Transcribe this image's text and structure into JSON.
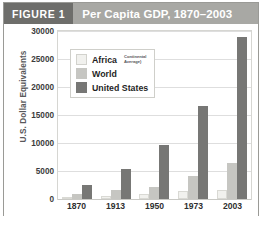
{
  "header": {
    "badge": "FIGURE 1",
    "title": "Per Capita GDP, 1870–2003"
  },
  "axis": {
    "ylabel": "U.S. Dollar Equivalents",
    "yticks": [
      "30000",
      "25000",
      "20000",
      "15000",
      "10000",
      "5000",
      "0"
    ]
  },
  "legend": {
    "items": [
      {
        "label": "Africa",
        "note_line1": "Continental",
        "note_line2": "Average)",
        "color": "#f1f1ee"
      },
      {
        "label": "World",
        "note_line1": "",
        "note_line2": "",
        "color": "#c6c6c2"
      },
      {
        "label": "United States",
        "note_line1": "",
        "note_line2": "",
        "color": "#777775"
      }
    ]
  },
  "colors": {
    "badge_bg": "#6e6e6b",
    "title_bg": "#a8a8a4",
    "africa": "#f1f1ee",
    "world": "#c6c6c2",
    "united_states": "#777775",
    "gridline": "#dedede"
  },
  "chart_data": {
    "type": "bar",
    "title": "Per Capita GDP, 1870–2003",
    "xlabel": "",
    "ylabel": "U.S. Dollar Equivalents",
    "categories": [
      "1870",
      "1913",
      "1950",
      "1973",
      "2003"
    ],
    "ylim": [
      0,
      30000
    ],
    "ytick_step": 5000,
    "grid": true,
    "legend_position": "inside-top-left",
    "series": [
      {
        "name": "Africa (Continental Average)",
        "values": [
          425,
          585,
          890,
          1410,
          1550
        ]
      },
      {
        "name": "World",
        "values": [
          875,
          1540,
          2110,
          4080,
          6500
        ]
      },
      {
        "name": "United States",
        "values": [
          2445,
          5300,
          9560,
          16690,
          29000
        ]
      }
    ]
  }
}
